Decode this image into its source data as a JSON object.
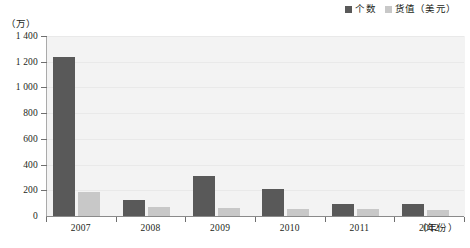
{
  "legend": {
    "position": "top-right",
    "items": [
      {
        "label": "个数",
        "color": "#595959",
        "name": "count"
      },
      {
        "label": "货值（美元）",
        "color": "#c8c8c8",
        "name": "value-usd"
      }
    ]
  },
  "axes": {
    "y_unit_label": "（万）",
    "x_title": "（年份）",
    "y_ticks": [
      "0",
      "200",
      "400",
      "600",
      "800",
      "1 000",
      "1 200",
      "1 400"
    ]
  },
  "colors": {
    "primary_bar": "#595959",
    "secondary_bar": "#c8c8c8",
    "plot_background": "#f3f3f3",
    "axis": "#8a8a8a",
    "gridline": "#e9e9e9",
    "text": "#231f20"
  },
  "chart_data": {
    "type": "bar",
    "title": "",
    "subtitle": "",
    "xlabel": "（年份）",
    "ylabel": "（万）",
    "ylim": [
      0,
      1400
    ],
    "ytick_step": 200,
    "grid": true,
    "legend_position": "top-right",
    "categories": [
      "2007",
      "2008",
      "2009",
      "2010",
      "2011",
      "2012"
    ],
    "series": [
      {
        "name": "个数",
        "color": "#595959",
        "values": [
          1235,
          125,
          310,
          210,
          95,
          90
        ]
      },
      {
        "name": "货值（美元）",
        "color": "#c8c8c8",
        "values": [
          185,
          70,
          65,
          55,
          55,
          50
        ]
      }
    ],
    "annotations": []
  }
}
